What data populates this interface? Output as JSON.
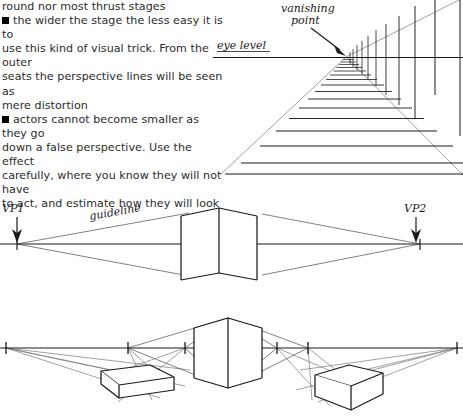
{
  "document": {
    "type": "scanned-book-page",
    "topic": "false perspective on thrust stages"
  },
  "text_block": {
    "lines": [
      "round nor most thrust stages",
      "the wider the stage the less easy it is to",
      "use this kind of visual trick. From the outer",
      "seats the perspective lines will be seen as",
      "mere distortion",
      "actors cannot become smaller as they go",
      "down a false perspective. Use the effect",
      "carefully, where you know they will not have",
      "to act, and estimate how they will look"
    ],
    "continuation_line": "round nor most thrust stages",
    "bullet1": {
      "marker": "filled-square-bullet",
      "lines": [
        "the wider the stage the less easy it is to",
        "use this kind of visual trick. From the outer",
        "seats the perspective lines will be seen as",
        "mere distortion"
      ]
    },
    "bullet2": {
      "marker": "filled-square-bullet",
      "lines": [
        "actors cannot become smaller as they go",
        "down a false perspective. Use the effect",
        "carefully, where you know they will not have",
        "to act, and estimate how they will look"
      ]
    }
  },
  "figure_one_point": {
    "name": "one-point-perspective-stage-diagram",
    "labels": {
      "vanishing_point": "vanishing\npoint",
      "vanishing_point_line1": "vanishing",
      "vanishing_point_line2": "point",
      "eye_level": "eye level"
    },
    "annotations": {
      "arrow": "arrow-pointing-to-vanishing-point",
      "horizon": "eye-level-horizon-line"
    },
    "colors": {
      "ink": "#1a1a1a",
      "faint_ink": "#777777",
      "paper": "#ffffff"
    },
    "floor_line_count": 16,
    "wing_line_count": 12
  },
  "figure_two_point_top": {
    "name": "two-point-perspective-single-box",
    "labels": {
      "vp1": "VP1",
      "vp2": "VP2",
      "guideline": "guideline"
    },
    "annotations": {
      "vp1_arrow": "arrow-pointing-down-to-vp1",
      "vp2_arrow": "arrow-pointing-down-to-vp2",
      "horizon": "eye-level-horizon-line",
      "box": "central-cube"
    }
  },
  "figure_two_point_bottom": {
    "name": "two-point-perspective-multiple-boxes",
    "annotations": {
      "horizon": "eye-level-horizon-line",
      "center_box": "central-cube",
      "left_box": "left-low-box",
      "right_box": "right-low-box",
      "tick_marks": "vanishing-point-tick-marks"
    },
    "tick_count": 6
  }
}
